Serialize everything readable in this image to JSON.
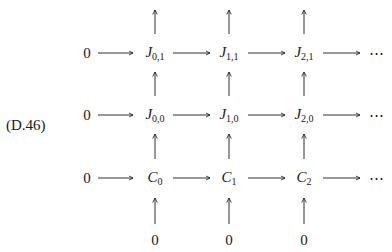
{
  "equation_label": "(D.46)",
  "diagram": {
    "type": "commutative-diagram",
    "columns": [
      "0",
      "col0",
      "col1",
      "col2",
      "..."
    ],
    "rows": [
      {
        "left": "0",
        "nodes": [
          {
            "base": "J",
            "sub": "0,1"
          },
          {
            "base": "J",
            "sub": "1,1"
          },
          {
            "base": "J",
            "sub": "2,1"
          }
        ],
        "right": "⋯"
      },
      {
        "left": "0",
        "nodes": [
          {
            "base": "J",
            "sub": "0,0"
          },
          {
            "base": "J",
            "sub": "1,0"
          },
          {
            "base": "J",
            "sub": "2,0"
          }
        ],
        "right": "⋯"
      },
      {
        "left": "0",
        "nodes": [
          {
            "base": "C",
            "sub": "0"
          },
          {
            "base": "C",
            "sub": "1"
          },
          {
            "base": "C",
            "sub": "2"
          }
        ],
        "right": "⋯"
      }
    ],
    "bottom_row": [
      "0",
      "0",
      "0"
    ],
    "arrow_direction": {
      "horizontal": "right",
      "vertical": "up"
    }
  },
  "nodes": {
    "r0_left": "0",
    "r1_left": "0",
    "r2_left": "0",
    "r0_right": "⋯",
    "r1_right": "⋯",
    "r2_right": "⋯",
    "J01": "J",
    "J01s": "0,1",
    "J11": "J",
    "J11s": "1,1",
    "J21": "J",
    "J21s": "2,1",
    "J00": "J",
    "J00s": "0,0",
    "J10": "J",
    "J10s": "1,0",
    "J20": "J",
    "J20s": "2,0",
    "C0": "C",
    "C0s": "0",
    "C1": "C",
    "C1s": "1",
    "C2": "C",
    "C2s": "2",
    "b0": "0",
    "b1": "0",
    "b2": "0"
  }
}
